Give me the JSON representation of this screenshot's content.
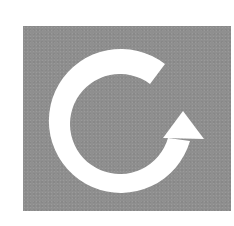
{
  "icon": {
    "name": "refresh-icon",
    "label": "Refresh",
    "tile_color": "#8f8f8f",
    "arrow_color": "#ffffff"
  }
}
